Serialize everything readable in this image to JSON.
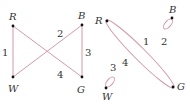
{
  "colors": {
    "edge": "#d49aa6",
    "vertex": "#111111",
    "text": "#333333",
    "background": "#ffffff"
  },
  "graphs": [
    {
      "name": "left-graph",
      "vertices": [
        {
          "id": "R",
          "label": "R"
        },
        {
          "id": "B",
          "label": "B"
        },
        {
          "id": "W",
          "label": "W"
        },
        {
          "id": "G",
          "label": "G"
        }
      ],
      "edges": [
        {
          "id": "e1",
          "from": "R",
          "to": "W",
          "label": "1"
        },
        {
          "id": "e2",
          "from": "W",
          "to": "B",
          "label": "2"
        },
        {
          "id": "e3",
          "from": "B",
          "to": "G",
          "label": "3"
        },
        {
          "id": "e4",
          "from": "R",
          "to": "G",
          "label": "4"
        }
      ]
    },
    {
      "name": "right-graph",
      "vertices": [
        {
          "id": "R",
          "label": "R"
        },
        {
          "id": "B",
          "label": "B"
        },
        {
          "id": "W",
          "label": "W"
        },
        {
          "id": "G",
          "label": "G"
        }
      ],
      "edges": [
        {
          "id": "e1",
          "from": "R",
          "to": "G",
          "label": "1"
        },
        {
          "id": "e2",
          "from": "B",
          "to": "B",
          "label": "2",
          "type": "loop"
        },
        {
          "id": "e3",
          "from": "W",
          "to": "W",
          "label": "3",
          "type": "loop"
        },
        {
          "id": "e4",
          "from": "R",
          "to": "G",
          "label": "4"
        }
      ]
    }
  ]
}
